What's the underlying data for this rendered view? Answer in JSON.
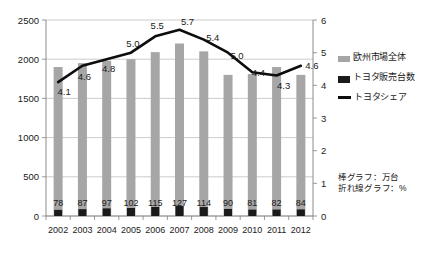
{
  "chart_data": {
    "type": "bar",
    "title": "",
    "subtitle": "",
    "xlabel": "",
    "ylabel": "",
    "categories": [
      "2002",
      "2003",
      "2004",
      "2005",
      "2006",
      "2007",
      "2008",
      "2009",
      "2010",
      "2011",
      "2012"
    ],
    "series": [
      {
        "name": "欧州市場全体",
        "type": "bar",
        "axis": "left",
        "color": "#a6a6a6",
        "values": [
          1900,
          1950,
          1980,
          2000,
          2090,
          2200,
          2100,
          1800,
          1810,
          1900,
          1800
        ],
        "labels_shown": false
      },
      {
        "name": "トヨタ販売台数",
        "type": "bar",
        "axis": "left",
        "color": "#1a1a1a",
        "values": [
          78,
          87,
          97,
          102,
          115,
          127,
          114,
          90,
          81,
          82,
          84
        ],
        "labels_shown": true,
        "labels": [
          "78",
          "87",
          "97",
          "102",
          "115",
          "127",
          "114",
          "90",
          "81",
          "82",
          "84"
        ]
      },
      {
        "name": "トヨタシェア",
        "type": "line",
        "axis": "right",
        "color": "#0d0d0d",
        "values": [
          4.1,
          4.6,
          4.8,
          5.0,
          5.5,
          5.7,
          5.4,
          5.0,
          4.4,
          4.3,
          4.6
        ],
        "labels_shown": true,
        "labels": [
          "4.1",
          "4.6",
          "4.8",
          "5.0",
          "5.5",
          "5.7",
          "5.4",
          "5.0",
          "4.4",
          "4.3",
          "4.6"
        ]
      }
    ],
    "left_axis": {
      "ylim": [
        0,
        2500
      ],
      "ticks": [
        0,
        500,
        1000,
        1500,
        2000,
        2500
      ],
      "tick_labels": [
        "0",
        "500",
        "1000",
        "1500",
        "2000",
        "2500"
      ]
    },
    "right_axis": {
      "ylim": [
        0,
        6
      ],
      "ticks": [
        0,
        1,
        2,
        3,
        4,
        5,
        6
      ],
      "tick_labels": [
        "0",
        "1",
        "2",
        "3",
        "4",
        "5",
        "6"
      ]
    },
    "grid": true,
    "legend_position": "right",
    "legend": [
      "欧州市場全体",
      "トヨタ販売台数",
      "トヨタシェア"
    ],
    "notes": [
      "棒グラフ：万台",
      "折れ線グラフ：%"
    ]
  },
  "legend": {
    "items": [
      {
        "label": "欧州市場全体",
        "swatch": "bar-grey-swatch"
      },
      {
        "label": "トヨタ販売台数",
        "swatch": "bar-black-swatch"
      },
      {
        "label": "トヨタシェア",
        "swatch": "line-black-swatch"
      }
    ]
  },
  "note": {
    "line1": "棒グラフ：万台",
    "line2": "折れ線グラフ：%"
  }
}
